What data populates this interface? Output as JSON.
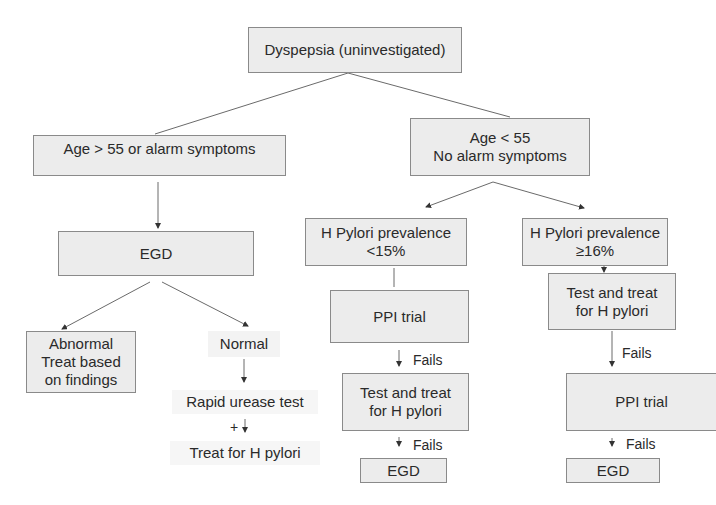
{
  "diagram": {
    "title": "Dyspepsia (uninvestigated)",
    "nodes": {
      "root": "Dyspepsia (uninvestigated)",
      "age_over": "Age > 55 or alarm symptoms",
      "age_under": "Age < 55\nNo alarm symptoms",
      "egd_left": "EGD",
      "abnormal": "Abnormal\nTreat based\non findings",
      "normal": "Normal",
      "rapid_urease": "Rapid urease test",
      "treat_hp": "Treat for H pylori",
      "hp_low": "H Pylori prevalence\n<15%",
      "hp_high": "H Pylori prevalence\n≥16%",
      "ppi_left": "PPI trial",
      "test_treat_left": "Test and treat\nfor H pylori",
      "egd_low": "EGD",
      "test_treat_right": "Test and treat\nfor H pylori",
      "ppi_right": "PPI trial",
      "egd_high": "EGD"
    },
    "edge_labels": {
      "fails_1": "Fails",
      "fails_2": "Fails",
      "fails_3": "Fails",
      "fails_4": "Fails",
      "positive": "+"
    },
    "colors": {
      "box_fill": "#ececec",
      "box_border": "#8a8a8a",
      "line": "#555555",
      "text": "#2a2a2a"
    }
  }
}
